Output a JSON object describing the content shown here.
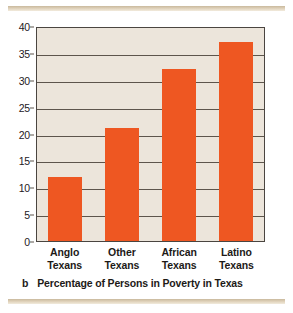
{
  "figure": {
    "panel_letter": "b",
    "caption": "Percentage of Persons in Poverty in Texas"
  },
  "colors": {
    "bar": "#EE5722",
    "plot_background": "#ECE5DB",
    "page_background": "#FFFFFF",
    "axis": "#4A4540",
    "gridline": "#5D554C",
    "rule": "#C9B99D",
    "text": "#1D1A17"
  },
  "chart_data": {
    "type": "bar",
    "title": "Percentage of Persons in Poverty in Texas",
    "xlabel": "",
    "ylabel": "",
    "categories": [
      "Anglo Texans",
      "Other Texans",
      "African Texans",
      "Latino Texans"
    ],
    "category_lines": [
      [
        "Anglo",
        "Texans"
      ],
      [
        "Other",
        "Texans"
      ],
      [
        "African",
        "Texans"
      ],
      [
        "Latino",
        "Texans"
      ]
    ],
    "values": [
      12,
      21,
      32,
      37
    ],
    "ylim": [
      0,
      40
    ],
    "yticks": [
      0,
      5,
      10,
      15,
      20,
      25,
      30,
      35,
      40
    ],
    "ytick_labels": [
      "0",
      "5",
      "10",
      "15",
      "20",
      "25",
      "30",
      "35",
      "40"
    ],
    "grid": true,
    "legend": false,
    "series_color": "#EE5722"
  }
}
